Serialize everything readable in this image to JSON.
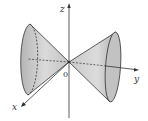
{
  "figure": {
    "labels": {
      "z_axis": "z",
      "y_axis": "y",
      "x_axis": "x",
      "origin": "0"
    },
    "colors": {
      "surface_fill": "#d4d4d4",
      "surface_dark": "#a8a8a8",
      "stroke": "#333333",
      "background": "#ffffff"
    }
  }
}
